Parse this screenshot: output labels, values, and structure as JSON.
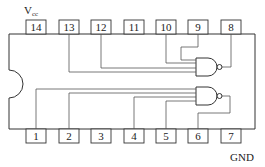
{
  "diagram": {
    "type": "14-pin DIP IC pinout with two NAND gates",
    "annotations": {
      "vcc_main": "V",
      "vcc_sub": "cc",
      "gnd": "GND"
    },
    "top_pins": [
      {
        "number": "14",
        "x": 30
      },
      {
        "number": "13",
        "x": 63
      },
      {
        "number": "12",
        "x": 96
      },
      {
        "number": "11",
        "x": 130
      },
      {
        "number": "10",
        "x": 163
      },
      {
        "number": "9",
        "x": 196
      },
      {
        "number": "8",
        "x": 229
      }
    ],
    "bottom_pins": [
      {
        "number": "1",
        "x": 30
      },
      {
        "number": "2",
        "x": 63
      },
      {
        "number": "3",
        "x": 96
      },
      {
        "number": "4",
        "x": 130
      },
      {
        "number": "5",
        "x": 163
      },
      {
        "number": "6",
        "x": 196
      },
      {
        "number": "7",
        "x": 229
      }
    ],
    "gates": [
      {
        "name": "NAND gate 1",
        "inputs": [
          "13",
          "12",
          "10",
          "9"
        ],
        "output": "8"
      },
      {
        "name": "NAND gate 2",
        "inputs": [
          "1",
          "2",
          "4",
          "5"
        ],
        "output": "6"
      }
    ]
  }
}
